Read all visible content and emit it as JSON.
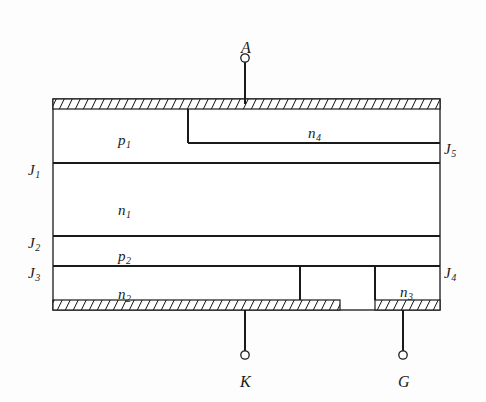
{
  "figure": {
    "type": "semiconductor-cross-section",
    "device": "thyristor",
    "background_color": "#fdfdfd",
    "line_color": "#1a1a1a"
  },
  "terminals": [
    {
      "id": "anode",
      "label": "A",
      "x": 241,
      "y": 40,
      "node_x": 245,
      "node_y": 58,
      "lead_from_y": 58,
      "lead_to_y": 104
    },
    {
      "id": "cathode",
      "label": "K",
      "x": 240,
      "y": 374,
      "node_x": 245,
      "node_y": 355,
      "lead_from_y": 310,
      "lead_to_y": 355
    },
    {
      "id": "gate",
      "label": "G",
      "x": 398,
      "y": 374,
      "node_x": 403,
      "node_y": 355,
      "lead_from_y": 310,
      "lead_to_y": 355
    }
  ],
  "layers": [
    {
      "id": "p1",
      "label": "p",
      "sub": "1",
      "x": 118,
      "y": 133
    },
    {
      "id": "n1",
      "label": "n",
      "sub": "1",
      "x": 118,
      "y": 203
    },
    {
      "id": "p2",
      "label": "p",
      "sub": "2",
      "x": 118,
      "y": 249
    },
    {
      "id": "n2",
      "label": "n",
      "sub": "2",
      "x": 118,
      "y": 287
    },
    {
      "id": "n3",
      "label": "n",
      "sub": "3",
      "x": 400,
      "y": 285
    },
    {
      "id": "n4",
      "label": "n",
      "sub": "4",
      "x": 308,
      "y": 126
    }
  ],
  "junctions": [
    {
      "id": "J1",
      "label": "J",
      "sub": "1",
      "x": 28,
      "y": 163,
      "side": "left"
    },
    {
      "id": "J2",
      "label": "J",
      "sub": "2",
      "x": 28,
      "y": 236,
      "side": "left"
    },
    {
      "id": "J3",
      "label": "J",
      "sub": "3",
      "x": 28,
      "y": 266,
      "side": "left"
    },
    {
      "id": "J4",
      "label": "J",
      "sub": "4",
      "x": 444,
      "y": 266,
      "side": "right"
    },
    {
      "id": "J5",
      "label": "J",
      "sub": "5",
      "x": 444,
      "y": 142,
      "side": "right"
    }
  ],
  "geometry": {
    "body_left": 53,
    "body_right": 440,
    "body_top": 99,
    "body_bottom": 310,
    "electrode_thickness": 10,
    "anode_electrode": {
      "x": 53,
      "y": 99,
      "w": 387,
      "h": 10
    },
    "cathode_electrode": {
      "x": 53,
      "y": 300,
      "w": 287,
      "h": 10
    },
    "gate_electrode": {
      "x": 375,
      "y": 300,
      "w": 65,
      "h": 10
    },
    "j1_line_y": 163,
    "j2_line_y": 236,
    "j3_line_y": 266,
    "n4_region": {
      "x": 188,
      "y": 109,
      "right": 440,
      "bottom": 143
    },
    "n3_region": {
      "x": 375,
      "y": 266,
      "right": 440,
      "bottom": 300
    },
    "n2_region": {
      "x": 53,
      "y": 266,
      "right": 300,
      "bottom": 300
    }
  }
}
